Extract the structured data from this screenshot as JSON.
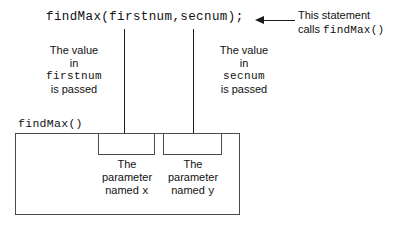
{
  "statement": {
    "code": "findMax(firstnum,secnum);"
  },
  "callout": {
    "line1": "This statement",
    "line2_prefix": "calls ",
    "line2_code": "findMax()"
  },
  "arguments": [
    {
      "line1": "The value",
      "line2": "in",
      "name": "firstnum",
      "line4": "is passed"
    },
    {
      "line1": "The value",
      "line2": "in",
      "name": "secnum",
      "line4": "is passed"
    }
  ],
  "function": {
    "label": "findMax()"
  },
  "parameters": [
    {
      "line1": "The",
      "line2": "parameter",
      "line3_prefix": "named ",
      "name": "x"
    },
    {
      "line1": "The",
      "line2": "parameter",
      "line3_prefix": "named ",
      "name": "y"
    }
  ],
  "colors": {
    "ink": "#111111",
    "line": "#4a4a4a",
    "background": "#ffffff"
  }
}
